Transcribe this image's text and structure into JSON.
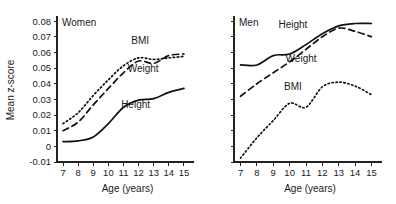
{
  "figure": {
    "xlabel": "Age (years)",
    "ylabel": "Mean z-score"
  },
  "chart_data": [
    {
      "type": "line",
      "title": "Women",
      "panel": "left",
      "xlabel": "Age (years)",
      "ylabel": "Mean z-score",
      "x": [
        7,
        8,
        9,
        10,
        11,
        12,
        13,
        14,
        15
      ],
      "xlim": [
        6.6,
        15.4
      ],
      "ylim": [
        -0.01,
        0.082
      ],
      "xticks": [
        7,
        8,
        9,
        10,
        11,
        12,
        13,
        14,
        15
      ],
      "xticklabels": [
        "7",
        "8",
        "9",
        "10",
        "11",
        "12",
        "13",
        "14",
        "15"
      ],
      "yticks": [
        -0.01,
        0,
        0.01,
        0.02,
        0.03,
        0.04,
        0.05,
        0.06,
        0.07,
        0.08
      ],
      "yticklabels": [
        "-0.01",
        "0",
        "0.01",
        "0.02",
        "0.03",
        "0.04",
        "0.05",
        "0.06",
        "0.07",
        "0.08"
      ],
      "grid": false,
      "legend": "inline-annotations",
      "series": [
        {
          "name": "BMI",
          "style": "dotted",
          "label_x": 12.1,
          "label_y": 0.0655,
          "values": [
            0.0145,
            0.0215,
            0.0325,
            0.0425,
            0.0515,
            0.0565,
            0.0555,
            0.0565,
            0.0575
          ]
        },
        {
          "name": "Weight",
          "style": "dashed",
          "label_x": 12.3,
          "label_y": 0.0475,
          "values": [
            0.01,
            0.0155,
            0.0265,
            0.037,
            0.047,
            0.0545,
            0.053,
            0.058,
            0.059
          ]
        },
        {
          "name": "Height",
          "style": "solid",
          "label_x": 11.8,
          "label_y": 0.0245,
          "values": [
            0.003,
            0.0035,
            0.006,
            0.0145,
            0.025,
            0.0295,
            0.0305,
            0.0345,
            0.037
          ]
        }
      ]
    },
    {
      "type": "line",
      "title": "Men",
      "panel": "right",
      "xlabel": "Age (years)",
      "ylabel": "",
      "x": [
        7,
        8,
        9,
        10,
        11,
        12,
        13,
        14,
        15
      ],
      "xlim": [
        6.6,
        15.4
      ],
      "ylim": [
        -0.01,
        0.082
      ],
      "xticks": [
        7,
        8,
        9,
        10,
        11,
        12,
        13,
        14,
        15
      ],
      "xticklabels": [
        "7",
        "8",
        "9",
        "10",
        "11",
        "12",
        "13",
        "14",
        "15"
      ],
      "yticks": [
        -0.01,
        0,
        0.01,
        0.02,
        0.03,
        0.04,
        0.05,
        0.06,
        0.07,
        0.08
      ],
      "yticklabels": [],
      "grid": false,
      "legend": "inline-annotations",
      "series": [
        {
          "name": "Height",
          "style": "solid",
          "label_x": 10.2,
          "label_y": 0.0755,
          "values": [
            0.052,
            0.052,
            0.058,
            0.059,
            0.065,
            0.072,
            0.077,
            0.0785,
            0.0785
          ]
        },
        {
          "name": "Weight",
          "style": "dashed",
          "label_x": 10.7,
          "label_y": 0.054,
          "values": [
            0.032,
            0.04,
            0.047,
            0.054,
            0.062,
            0.07,
            0.0755,
            0.0735,
            0.07
          ]
        },
        {
          "name": "BMI",
          "style": "dotted",
          "label_x": 10.2,
          "label_y": 0.036,
          "values": [
            -0.0075,
            0.0055,
            0.0165,
            0.0275,
            0.025,
            0.038,
            0.041,
            0.0385,
            0.033
          ]
        }
      ]
    }
  ]
}
